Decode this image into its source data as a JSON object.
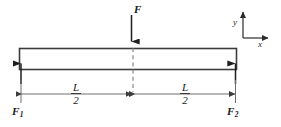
{
  "figure": {
    "background_color": "#ffffff",
    "line_color": "#3c3c3c",
    "beam_fill": "#ffffff",
    "text_color": "#1a1a1a"
  },
  "labels": {
    "applied_force": "F",
    "reaction_left": "F",
    "reaction_left_sub": "1",
    "reaction_right": "F",
    "reaction_right_sub": "2",
    "axis_y": "y",
    "axis_x": "x",
    "span_left_numerator": "L",
    "span_left_denominator": "2",
    "span_right_numerator": "L",
    "span_right_denominator": "2"
  },
  "geometry": {
    "beam_left_x": 19,
    "beam_right_x": 237,
    "beam_top_y": 48,
    "beam_bottom_y": 70,
    "center_x": 133,
    "dimension_line_y": 94,
    "load_arrow_top_y": 15,
    "axes_origin_x": 243,
    "axes_origin_y": 38
  }
}
